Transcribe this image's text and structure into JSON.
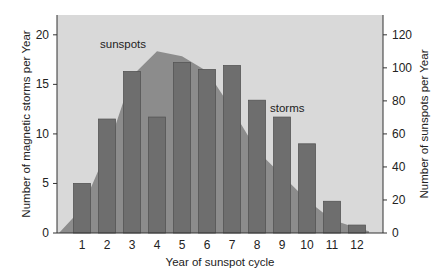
{
  "chart_data": {
    "type": "bar",
    "title": "",
    "xlabel": "Year of sunspot cycle",
    "ylabel": "Number of magnetic storms per Year",
    "ylabel_right": "Number of sunspots per Year",
    "categories": [
      "1",
      "2",
      "3",
      "4",
      "5",
      "6",
      "7",
      "8",
      "9",
      "10",
      "11",
      "12"
    ],
    "ylim": [
      0,
      22
    ],
    "ylim_right": [
      0,
      132
    ],
    "yticks": [
      0,
      5,
      10,
      15,
      20
    ],
    "yticks_right": [
      0,
      20,
      40,
      60,
      80,
      100,
      120
    ],
    "grid": false,
    "series": [
      {
        "name": "storms",
        "type": "bar",
        "axis": "left",
        "values": [
          5,
          11.5,
          16.3,
          11.7,
          17.2,
          16.5,
          16.9,
          13.4,
          11.7,
          9,
          3.2,
          0.8
        ]
      },
      {
        "name": "sunspots",
        "type": "area",
        "axis": "right",
        "values": [
          15,
          50,
          95,
          110,
          107,
          98,
          75,
          50,
          35,
          20,
          8,
          3
        ]
      }
    ],
    "annotations": [
      {
        "text": "sunspots",
        "near": "cycle 2-3"
      },
      {
        "text": "storms",
        "near": "cycle 8-9"
      }
    ]
  },
  "labels": {
    "sunspots": "sunspots",
    "storms": "storms"
  },
  "colors": {
    "plot_bg": "#d9d9d9",
    "area": "#8c8c8c",
    "bar": "#6e6e6e",
    "bar_edge": "#555555"
  }
}
